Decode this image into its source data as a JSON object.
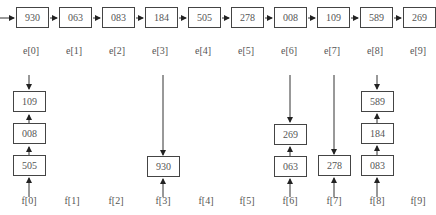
{
  "top_list": {
    "entries": [
      "930",
      "063",
      "083",
      "184",
      "505",
      "278",
      "008",
      "109",
      "589",
      "269"
    ],
    "labels": [
      "e[0]",
      "e[1]",
      "e[2]",
      "e[3]",
      "e[4]",
      "e[5]",
      "e[6]",
      "e[7]",
      "e[8]",
      "e[9]"
    ]
  },
  "bottom_labels": [
    "f[0]",
    "f[1]",
    "f[2]",
    "f[3]",
    "f[4]",
    "f[5]",
    "f[6]",
    "f[7]",
    "f[8]",
    "f[9]"
  ],
  "buckets": {
    "f0": [
      "505",
      "008",
      "109"
    ],
    "f3": [
      "930"
    ],
    "f6": [
      "063",
      "269"
    ],
    "f7": [
      "278"
    ],
    "f8": [
      "083",
      "184",
      "589"
    ]
  }
}
